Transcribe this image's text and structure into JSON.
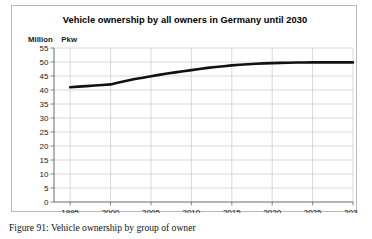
{
  "figure": {
    "caption": "Figure 91: Vehicle ownership by group of owner"
  },
  "chart_data": {
    "type": "line",
    "title": "Vehicle ownership by all owners in Germany until 2030",
    "xlabel": "",
    "ylabel": "",
    "unit_label": "Million  Pkw",
    "unit_label_parts": {
      "million": "Million",
      "pkw": "Pkw"
    },
    "xlim": [
      1993,
      2030
    ],
    "ylim": [
      0,
      55
    ],
    "xticks": [
      1995,
      2000,
      2005,
      2010,
      2015,
      2020,
      2025,
      2030
    ],
    "xtick_labels": [
      "1995",
      "2000",
      "2005",
      "2010",
      "2015",
      "2020",
      "2025",
      "2030"
    ],
    "yticks": [
      0,
      5,
      10,
      15,
      20,
      25,
      30,
      35,
      40,
      45,
      50,
      55
    ],
    "ytick_labels": [
      "0",
      "5",
      "10",
      "15",
      "20",
      "25",
      "30",
      "35",
      "40",
      "45",
      "50",
      "55"
    ],
    "grid": true,
    "grid_color": "#c8c8c8",
    "legend": null,
    "line_color": "#111111",
    "line_width": 2.6,
    "series": [
      {
        "name": "Vehicle ownership by all owners",
        "x": [
          1995,
          1996,
          1997,
          1998,
          1999,
          2000,
          2001,
          2002,
          2003,
          2004,
          2005,
          2006,
          2007,
          2008,
          2009,
          2010,
          2011,
          2012,
          2013,
          2014,
          2015,
          2016,
          2017,
          2018,
          2019,
          2020,
          2021,
          2022,
          2023,
          2024,
          2025,
          2026,
          2027,
          2028,
          2029,
          2030
        ],
        "values": [
          41.0,
          41.2,
          41.4,
          41.6,
          41.8,
          42.0,
          42.7,
          43.3,
          43.9,
          44.4,
          44.9,
          45.4,
          45.9,
          46.3,
          46.7,
          47.1,
          47.5,
          47.9,
          48.2,
          48.5,
          48.8,
          49.0,
          49.2,
          49.35,
          49.5,
          49.6,
          49.7,
          49.75,
          49.8,
          49.8,
          49.85,
          49.85,
          49.85,
          49.85,
          49.85,
          49.85
        ]
      }
    ]
  }
}
